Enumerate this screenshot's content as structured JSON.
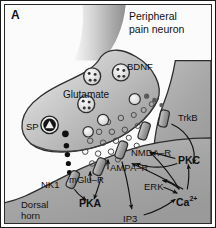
{
  "figure": {
    "panel_letter": "A",
    "title": "Peripheral\npain neuron",
    "caption_cell_label": "Dorsal\nhorn\nneuron"
  },
  "labels": {
    "bdnf": "BDNF",
    "glutamate": "Glutamate",
    "sp": "SP",
    "trkb": "TrkB",
    "nmda_r": "NMDA–R",
    "ampa_r": "AMPA–R",
    "mglu_r": "mGlu–R",
    "nk1": "NK1",
    "pkc": "PKC",
    "pka": "PKA",
    "erk": "ERK",
    "ip3": "IP3",
    "calcium": "Ca",
    "calcium_charge": "2+"
  },
  "colors": {
    "border": "#1a1a1a",
    "ink": "#111111",
    "presynaptic_fill": "#b9b9b9",
    "postsynaptic_fill": "#a8a8a8",
    "axon_fill": "#cdcdcd",
    "receptor_fill": "#9a9a9a",
    "vesicle_fill": "#e6e6e6",
    "sp_vesicle_fill": "#1a1a1a",
    "cleft_fill": "#f2f2f2",
    "background": "#ffffff"
  },
  "diagram": {
    "type": "biological-schematic",
    "vesicles": [
      {
        "name": "glutamate-vesicle-1",
        "cx": 88,
        "cy": 72,
        "r": 9
      },
      {
        "name": "bdnf-vesicle",
        "cx": 117,
        "cy": 68,
        "r": 9
      },
      {
        "name": "glutamate-vesicle-2",
        "cx": 82,
        "cy": 100,
        "r": 9
      },
      {
        "name": "sp-vesicle",
        "cx": 45,
        "cy": 121,
        "r": 9
      }
    ],
    "receptors": [
      {
        "name": "trkb-receptor",
        "x": 160,
        "y": 112
      },
      {
        "name": "nmda-receptor",
        "x": 140,
        "y": 126
      },
      {
        "name": "ampa-receptor",
        "x": 118,
        "y": 146
      },
      {
        "name": "mglu-receptor",
        "x": 95,
        "y": 163
      },
      {
        "name": "nk1-receptor",
        "x": 68,
        "y": 175
      }
    ],
    "signalling_arrows": [
      {
        "from": "nk1",
        "to": "pka"
      },
      {
        "from": "mglu-r",
        "to": "pka"
      },
      {
        "from": "ampa-r",
        "to": "ip3"
      },
      {
        "from": "ip3",
        "to": "calcium"
      },
      {
        "from": "erk",
        "to": "calcium"
      },
      {
        "from": "calcium",
        "to": "erk"
      },
      {
        "from": "calcium",
        "to": "nmda-r"
      },
      {
        "from": "pkc",
        "to": "nmda-r"
      },
      {
        "from": "calcium",
        "to": "pkc"
      },
      {
        "from": "trkb",
        "to": "pkc"
      },
      {
        "from": "calcium",
        "to": "ampa-r"
      },
      {
        "from": "pkc",
        "to": "ampa-r"
      }
    ],
    "glutamate_molecules_in_cleft": 22,
    "substance_p_trail_dots": 6
  }
}
